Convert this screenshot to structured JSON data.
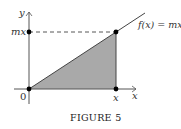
{
  "figure": {
    "caption": "FIGURE 5",
    "function_label": "f(x) = mx",
    "y_axis_label": "y",
    "x_axis_label": "x",
    "origin_label": "0",
    "point_x_label": "x",
    "point_y_label": "mx",
    "colors": {
      "shade": "#a9a9a9",
      "line": "#444444",
      "dot": "#000000"
    }
  }
}
